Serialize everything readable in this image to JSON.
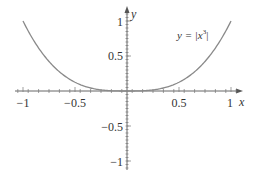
{
  "chart_data": {
    "type": "line",
    "title": "",
    "xlabel": "x",
    "ylabel": "y",
    "xlim": [
      -1,
      1
    ],
    "ylim": [
      -1,
      1
    ],
    "grid": false,
    "x_ticks": [
      -1,
      -0.5,
      0.5,
      1
    ],
    "x_tick_labels": [
      "−1",
      "−0.5",
      "0.5",
      "1"
    ],
    "y_ticks": [
      1,
      0.5,
      -0.5,
      -1
    ],
    "y_tick_labels": [
      "1",
      "0.5",
      "−0.5",
      "−1"
    ],
    "series": [
      {
        "name": "y = |x^3|",
        "function": "abs(x^3)",
        "x": [
          -1,
          -0.9,
          -0.8,
          -0.7,
          -0.6,
          -0.5,
          -0.4,
          -0.3,
          -0.2,
          -0.1,
          0,
          0.1,
          0.2,
          0.3,
          0.4,
          0.5,
          0.6,
          0.7,
          0.8,
          0.9,
          1
        ],
        "values": [
          1,
          0.729,
          0.512,
          0.343,
          0.216,
          0.125,
          0.064,
          0.027,
          0.008,
          0.001,
          0,
          0.001,
          0.008,
          0.027,
          0.064,
          0.125,
          0.216,
          0.343,
          0.512,
          0.729,
          1
        ]
      }
    ],
    "annotations": [
      {
        "text": "y = |x³|",
        "x": 0.62,
        "y": 0.83
      }
    ]
  },
  "labels": {
    "x_axis": "x",
    "y_axis": "y",
    "equation_lhs": "y = |x",
    "equation_exp": "3",
    "equation_rhs": "|",
    "xt0": "−1",
    "xt1": "−0.5",
    "xt2": "0.5",
    "xt3": "1",
    "yt0": "1",
    "yt1": "0.5",
    "yt2": "−0.5",
    "yt3": "−1"
  },
  "colors": {
    "curve": "#8a8a8a",
    "axis": "#666666"
  }
}
